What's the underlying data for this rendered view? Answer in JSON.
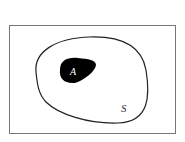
{
  "diagram": {
    "type": "venn",
    "universe": {
      "label": "S",
      "frame_color": "#777777"
    },
    "sample_space_region": {
      "label": "S",
      "outline_color": "#222222"
    },
    "event": {
      "label": "A",
      "fill_color": "#000000",
      "label_color": "#ffffff"
    }
  }
}
